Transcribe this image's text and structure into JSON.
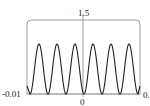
{
  "chart_data": {
    "type": "line",
    "title": "",
    "xlabel": "",
    "ylabel": "",
    "x_tick_labels": [
      "-0.01",
      "0",
      "0."
    ],
    "y_tick_labels": [
      "1.5"
    ],
    "xlim": [
      -0.01,
      0.01
    ],
    "ylim": [
      0,
      1.5
    ],
    "grid": false,
    "legend": null,
    "series": [
      {
        "name": "oscillation",
        "description": "periodic curve with 6 peaks (~1.0) and 7 troughs (0) across the x-range",
        "peak_value": 1.0,
        "trough_value": 0,
        "num_peaks": 6
      }
    ]
  },
  "labels": {
    "ymax": "1.5",
    "xmin": "-0.01",
    "xzero": "0",
    "xmax": "0."
  }
}
